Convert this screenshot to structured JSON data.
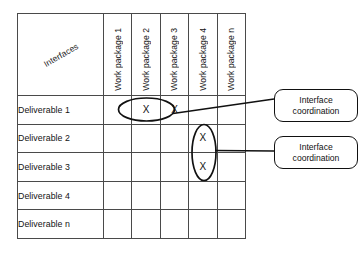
{
  "diagram": {
    "corner_label": "Interfaces",
    "columns": [
      {
        "label": "Work package 1"
      },
      {
        "label": "Work package 2"
      },
      {
        "label": "Work package 3"
      },
      {
        "label": "Work package 4"
      },
      {
        "label": "Work package n"
      }
    ],
    "rows": [
      {
        "label": "Deliverable 1",
        "cells": [
          {
            "fill": "black",
            "mark": ""
          },
          {
            "fill": "white",
            "mark": "X"
          },
          {
            "fill": "white",
            "mark": "X"
          },
          {
            "fill": "white",
            "mark": ""
          },
          {
            "fill": "white",
            "mark": ""
          }
        ]
      },
      {
        "label": "Deliverable 2",
        "cells": [
          {
            "fill": "gray",
            "mark": ""
          },
          {
            "fill": "black",
            "mark": ""
          },
          {
            "fill": "white",
            "mark": ""
          },
          {
            "fill": "white",
            "mark": "X"
          },
          {
            "fill": "white",
            "mark": ""
          }
        ]
      },
      {
        "label": "Deliverable 3",
        "cells": [
          {
            "fill": "gray",
            "mark": ""
          },
          {
            "fill": "gray",
            "mark": ""
          },
          {
            "fill": "black",
            "mark": ""
          },
          {
            "fill": "white",
            "mark": "X"
          },
          {
            "fill": "white",
            "mark": ""
          }
        ]
      },
      {
        "label": "Deliverable 4",
        "cells": [
          {
            "fill": "gray",
            "mark": ""
          },
          {
            "fill": "gray",
            "mark": ""
          },
          {
            "fill": "gray",
            "mark": ""
          },
          {
            "fill": "black",
            "mark": ""
          },
          {
            "fill": "white",
            "mark": ""
          }
        ]
      },
      {
        "label": "Deliverable n",
        "cells": [
          {
            "fill": "gray",
            "mark": ""
          },
          {
            "fill": "gray",
            "mark": ""
          },
          {
            "fill": "gray",
            "mark": ""
          },
          {
            "fill": "gray",
            "mark": ""
          },
          {
            "fill": "black",
            "mark": ""
          }
        ]
      }
    ],
    "annotations": [
      {
        "id": "callout-1",
        "line1": "Interface",
        "line2": "coordination"
      },
      {
        "id": "callout-2",
        "line1": "Interface",
        "line2": "coordination"
      }
    ],
    "colors": {
      "diagonal": "#121212",
      "lower_triangle": "#a8a8a8",
      "upper_triangle": "#ffffff",
      "grid_line": "#4a4a4a",
      "annotation_stroke": "#111111"
    }
  }
}
